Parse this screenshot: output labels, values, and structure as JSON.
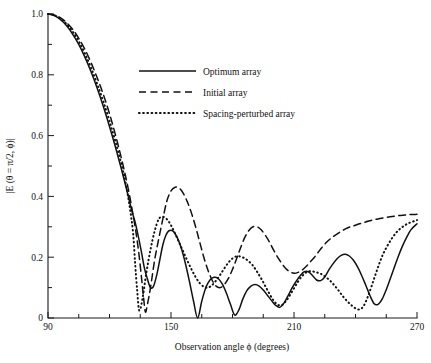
{
  "chart_data": {
    "type": "line",
    "title": "",
    "xlabel": "Observation angle ϕ (degrees)",
    "ylabel": "|E (θ = π/2, ϕ)|",
    "xlim": [
      90,
      270
    ],
    "ylim": [
      0,
      1.0
    ],
    "grid": false,
    "legend_position": "upper-center",
    "xticks": [
      90,
      105,
      120,
      135,
      150,
      165,
      180,
      195,
      210,
      225,
      240,
      255,
      270
    ],
    "xtick_labels": [
      "90",
      "",
      "",
      "",
      "150",
      "",
      "",
      "",
      "210",
      "",
      "",
      "",
      "270"
    ],
    "yticks": [
      0,
      0.1,
      0.2,
      0.3,
      0.4,
      0.5,
      0.6,
      0.7,
      0.8,
      0.9,
      1.0
    ],
    "ytick_labels": [
      "0",
      "",
      "0.2",
      "",
      "0.4",
      "",
      "0.6",
      "",
      "0.8",
      "",
      "1.0"
    ],
    "series": [
      {
        "name": "Optimum array",
        "style": "solid",
        "color": "#111111",
        "x": [
          90,
          93,
          96,
          99,
          102,
          105,
          108,
          111,
          114,
          117,
          120,
          123,
          126,
          129,
          131,
          132.5,
          134,
          135.5,
          137,
          138.5,
          140,
          141.5,
          143,
          144.5,
          146,
          147.5,
          149,
          151,
          153,
          155,
          157,
          159,
          161,
          163,
          165,
          167,
          169,
          171,
          173,
          175,
          177,
          179,
          181,
          183,
          185,
          187,
          189,
          191,
          193,
          195,
          197,
          199,
          201,
          203,
          205,
          207,
          209,
          211,
          213,
          215,
          217,
          219,
          221,
          223,
          225,
          227,
          229,
          231,
          233,
          235,
          237,
          239,
          241,
          243,
          245,
          247,
          249,
          251,
          253,
          255,
          257,
          259,
          261,
          263,
          265,
          267,
          270
        ],
        "y": [
          1.0,
          0.995,
          0.982,
          0.962,
          0.934,
          0.9,
          0.858,
          0.81,
          0.756,
          0.696,
          0.63,
          0.56,
          0.485,
          0.405,
          0.35,
          0.315,
          0.27,
          0.22,
          0.165,
          0.128,
          0.1,
          0.105,
          0.14,
          0.19,
          0.24,
          0.272,
          0.287,
          0.286,
          0.265,
          0.23,
          0.18,
          0.12,
          0.055,
          0.0,
          0.055,
          0.1,
          0.125,
          0.134,
          0.13,
          0.112,
          0.082,
          0.045,
          0.01,
          0.025,
          0.062,
          0.09,
          0.105,
          0.11,
          0.105,
          0.092,
          0.075,
          0.058,
          0.042,
          0.035,
          0.048,
          0.072,
          0.098,
          0.12,
          0.139,
          0.152,
          0.152,
          0.14,
          0.125,
          0.123,
          0.135,
          0.158,
          0.178,
          0.195,
          0.206,
          0.21,
          0.204,
          0.19,
          0.168,
          0.14,
          0.108,
          0.075,
          0.048,
          0.045,
          0.062,
          0.093,
          0.13,
          0.168,
          0.205,
          0.238,
          0.266,
          0.29,
          0.31
        ]
      },
      {
        "name": "Initial array",
        "style": "dashed",
        "color": "#111111",
        "x": [
          90,
          93,
          96,
          99,
          102,
          105,
          108,
          111,
          114,
          117,
          120,
          123,
          126,
          129,
          132,
          134,
          135.5,
          136.5,
          137.5,
          138.5,
          140,
          142,
          144,
          146,
          148,
          150,
          152,
          154,
          156,
          158,
          160,
          162,
          164,
          166,
          168,
          170,
          172,
          174,
          176,
          178,
          180,
          182,
          184,
          186,
          188,
          190,
          192,
          194,
          196,
          198,
          200,
          202,
          204,
          206,
          208,
          210,
          212,
          214,
          216,
          218,
          220,
          222,
          224,
          226,
          228,
          230,
          233,
          236,
          239,
          242,
          245,
          248,
          251,
          254,
          257,
          260,
          263,
          266,
          270
        ],
        "y": [
          1.0,
          0.997,
          0.988,
          0.972,
          0.95,
          0.92,
          0.884,
          0.84,
          0.79,
          0.735,
          0.672,
          0.6,
          0.52,
          0.43,
          0.32,
          0.23,
          0.14,
          0.075,
          0.02,
          0.045,
          0.1,
          0.19,
          0.26,
          0.325,
          0.385,
          0.418,
          0.43,
          0.427,
          0.41,
          0.382,
          0.345,
          0.3,
          0.25,
          0.2,
          0.158,
          0.125,
          0.105,
          0.1,
          0.11,
          0.13,
          0.16,
          0.195,
          0.232,
          0.265,
          0.288,
          0.3,
          0.3,
          0.29,
          0.272,
          0.25,
          0.224,
          0.2,
          0.18,
          0.163,
          0.152,
          0.147,
          0.15,
          0.158,
          0.17,
          0.185,
          0.2,
          0.218,
          0.235,
          0.25,
          0.262,
          0.272,
          0.285,
          0.296,
          0.303,
          0.31,
          0.316,
          0.322,
          0.326,
          0.33,
          0.333,
          0.336,
          0.338,
          0.34,
          0.341
        ]
      },
      {
        "name": "Spacing-perturbed array",
        "style": "dotted",
        "color": "#111111",
        "x": [
          90,
          93,
          96,
          99,
          102,
          105,
          108,
          111,
          114,
          117,
          120,
          123,
          126,
          128,
          130,
          131.5,
          132.5,
          133.5,
          134.5,
          136,
          138,
          140,
          142,
          144,
          146,
          148,
          150,
          152,
          154,
          156,
          158,
          160,
          162,
          164,
          166,
          168,
          170,
          172,
          174,
          176,
          178,
          180,
          182,
          184,
          186,
          188,
          190,
          192,
          194,
          196,
          198,
          200,
          202,
          204,
          206,
          208,
          210,
          212,
          214,
          216,
          218,
          220,
          222,
          224,
          226,
          228,
          230,
          232,
          234,
          236,
          238,
          240,
          242,
          244,
          246,
          248,
          250,
          252,
          254,
          257,
          260,
          263,
          266,
          270
        ],
        "y": [
          1.0,
          0.996,
          0.985,
          0.967,
          0.942,
          0.91,
          0.87,
          0.823,
          0.77,
          0.712,
          0.648,
          0.578,
          0.5,
          0.44,
          0.36,
          0.28,
          0.18,
          0.09,
          0.025,
          0.06,
          0.15,
          0.225,
          0.285,
          0.325,
          0.333,
          0.325,
          0.305,
          0.278,
          0.248,
          0.218,
          0.188,
          0.16,
          0.135,
          0.115,
          0.103,
          0.1,
          0.108,
          0.123,
          0.142,
          0.163,
          0.182,
          0.196,
          0.203,
          0.202,
          0.196,
          0.186,
          0.172,
          0.152,
          0.13,
          0.105,
          0.08,
          0.058,
          0.044,
          0.042,
          0.055,
          0.075,
          0.098,
          0.12,
          0.138,
          0.15,
          0.154,
          0.152,
          0.148,
          0.142,
          0.132,
          0.12,
          0.105,
          0.088,
          0.07,
          0.055,
          0.042,
          0.032,
          0.028,
          0.04,
          0.07,
          0.108,
          0.148,
          0.186,
          0.218,
          0.254,
          0.282,
          0.3,
          0.312,
          0.322
        ]
      }
    ]
  },
  "legend": {
    "items": [
      {
        "label": "Optimum array",
        "style": "solid"
      },
      {
        "label": "Initial array",
        "style": "dashed"
      },
      {
        "label": "Spacing-perturbed array",
        "style": "dotted"
      }
    ]
  }
}
